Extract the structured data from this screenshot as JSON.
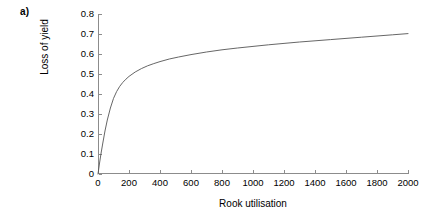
{
  "figure": {
    "panel_label": "a)"
  },
  "chart_data": {
    "type": "line",
    "title": "",
    "xlabel": "Rook utilisation",
    "ylabel": "Loss of yield",
    "xlim": [
      0,
      2000
    ],
    "ylim": [
      0,
      0.8
    ],
    "grid": false,
    "legend": null,
    "xticks": [
      0,
      200,
      400,
      600,
      800,
      1000,
      1200,
      1400,
      1600,
      1800,
      2000
    ],
    "xtick_labels": [
      "0",
      "200",
      "400",
      "600",
      "800",
      "1000",
      "1200",
      "1400",
      "1600",
      "1800",
      "2000"
    ],
    "yticks": [
      0,
      0.1,
      0.2,
      0.3,
      0.4,
      0.5,
      0.6,
      0.7,
      0.8
    ],
    "ytick_labels": [
      "0",
      "0.1",
      "0.2",
      "0.3",
      "0.4",
      "0.5",
      "0.6",
      "0.7",
      "0.8"
    ],
    "series": [
      {
        "name": "Loss of yield vs rook utilisation",
        "color": "#555555",
        "x": [
          0,
          10,
          20,
          30,
          45,
          60,
          80,
          100,
          120,
          140,
          160,
          180,
          200,
          240,
          280,
          320,
          360,
          400,
          460,
          520,
          600,
          700,
          800,
          900,
          1000,
          1100,
          1200,
          1300,
          1400,
          1500,
          1600,
          1700,
          1800,
          1900,
          2000
        ],
        "y": [
          0.0,
          0.055,
          0.105,
          0.15,
          0.215,
          0.27,
          0.33,
          0.378,
          0.412,
          0.438,
          0.458,
          0.474,
          0.488,
          0.51,
          0.527,
          0.541,
          0.552,
          0.562,
          0.575,
          0.585,
          0.597,
          0.61,
          0.621,
          0.63,
          0.638,
          0.646,
          0.653,
          0.66,
          0.666,
          0.672,
          0.678,
          0.684,
          0.69,
          0.696,
          0.702
        ]
      }
    ]
  },
  "style": {
    "axis_color": "#8c8c8c",
    "curve_color": "#555555",
    "text_color": "#000000",
    "background": "#ffffff"
  }
}
